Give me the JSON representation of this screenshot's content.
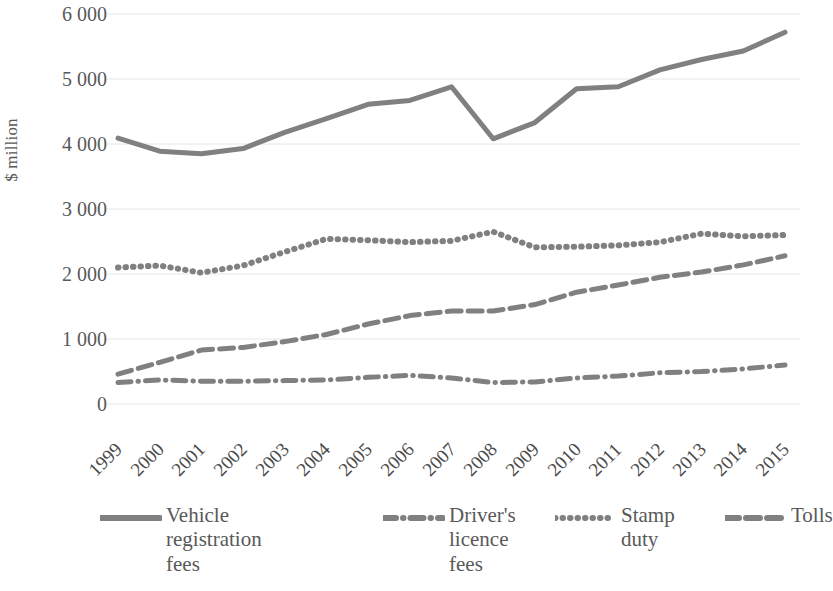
{
  "chart_data": {
    "type": "line",
    "title": "",
    "xlabel": "",
    "ylabel": "$ million",
    "categories": [
      "1999",
      "2000",
      "2001",
      "2002",
      "2003",
      "2004",
      "2005",
      "2006",
      "2007",
      "2008",
      "2009",
      "2010",
      "2011",
      "2012",
      "2013",
      "2014",
      "2015"
    ],
    "ylim": [
      0,
      6000
    ],
    "ytick_labels": [
      "0",
      "1 000",
      "2 000",
      "3 000",
      "4 000",
      "5 000",
      "6 000"
    ],
    "ytick_values": [
      0,
      1000,
      2000,
      3000,
      4000,
      5000,
      6000
    ],
    "grid": true,
    "grid_axis": "y",
    "legend_position": "bottom",
    "series": [
      {
        "name": "Vehicle registration fees",
        "legend_label": "Vehicle\nregistration\nfees",
        "style": "solid",
        "color": "#808080",
        "values": [
          4090,
          3890,
          3850,
          3930,
          4180,
          4390,
          4610,
          4670,
          4880,
          4080,
          4330,
          4850,
          4880,
          5140,
          5300,
          5430,
          5720
        ]
      },
      {
        "name": "Driver's licence fees",
        "legend_label": "Driver's\nlicence\nfees",
        "style": "dashdot",
        "color": "#808080",
        "values": [
          330,
          370,
          350,
          350,
          360,
          370,
          410,
          440,
          400,
          330,
          340,
          400,
          430,
          480,
          500,
          540,
          600
        ]
      },
      {
        "name": "Stamp duty",
        "legend_label": "Stamp\nduty",
        "style": "dotted",
        "color": "#808080",
        "values": [
          2100,
          2130,
          2020,
          2130,
          2340,
          2540,
          2520,
          2490,
          2510,
          2650,
          2410,
          2420,
          2440,
          2490,
          2620,
          2580,
          2600
        ]
      },
      {
        "name": "Tolls",
        "legend_label": "Tolls",
        "style": "dashed",
        "color": "#808080",
        "values": [
          460,
          640,
          830,
          870,
          960,
          1070,
          1230,
          1360,
          1430,
          1430,
          1530,
          1720,
          1830,
          1950,
          2030,
          2140,
          2280
        ]
      }
    ]
  },
  "axes": {
    "y_title": "$ million"
  }
}
